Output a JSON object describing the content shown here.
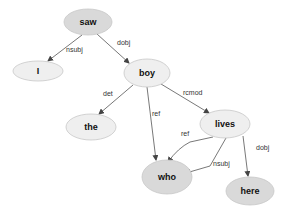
{
  "diagram": {
    "type": "dependency-graph",
    "colors": {
      "light_fill": "#efefef",
      "dark_fill": "#d9d9d9",
      "stroke": "#c8c8c8",
      "edge": "#555555"
    },
    "nodes": [
      {
        "id": "saw",
        "label": "saw",
        "cx": 88,
        "cy": 22,
        "rx": 24,
        "ry": 13,
        "fill": "#d9d9d9"
      },
      {
        "id": "I",
        "label": "I",
        "cx": 38,
        "cy": 71,
        "rx": 25,
        "ry": 10,
        "fill": "#efefef"
      },
      {
        "id": "boy",
        "label": "boy",
        "cx": 147,
        "cy": 73,
        "rx": 23,
        "ry": 14,
        "fill": "#efefef"
      },
      {
        "id": "the",
        "label": "the",
        "cx": 91,
        "cy": 127,
        "rx": 25,
        "ry": 13,
        "fill": "#efefef"
      },
      {
        "id": "lives",
        "label": "lives",
        "cx": 225,
        "cy": 124,
        "rx": 25,
        "ry": 14,
        "fill": "#efefef"
      },
      {
        "id": "who",
        "label": "who",
        "cx": 167,
        "cy": 177,
        "rx": 25,
        "ry": 17,
        "fill": "#d9d9d9"
      },
      {
        "id": "here",
        "label": "here",
        "cx": 250,
        "cy": 191,
        "rx": 24,
        "ry": 14,
        "fill": "#d9d9d9"
      }
    ],
    "edges": [
      {
        "from": "saw",
        "to": "I",
        "label": "nsubj",
        "path": "M82,35 L48,61",
        "lx": 66,
        "ly": 52
      },
      {
        "from": "saw",
        "to": "boy",
        "label": "dobj",
        "path": "M97,34 L129,63",
        "lx": 117,
        "ly": 45
      },
      {
        "from": "boy",
        "to": "the",
        "label": "det",
        "path": "M133,85 L99,114",
        "lx": 103,
        "ly": 96
      },
      {
        "from": "boy",
        "to": "who",
        "label": "ref",
        "path": "M147,87 L156,160",
        "lx": 152,
        "ly": 116
      },
      {
        "from": "boy",
        "to": "lives",
        "label": "rcmod",
        "path": "M161,84 L209,113",
        "lx": 183,
        "ly": 95
      },
      {
        "from": "lives",
        "to": "who",
        "label": "ref",
        "path": "M213,137 L190,142 Q178,148 168,162",
        "lx": 181,
        "ly": 136
      },
      {
        "from": "lives",
        "to": "who",
        "label": "nsubj",
        "path": "M226,138 L210,166 L186,173",
        "lx": 213,
        "ly": 166
      },
      {
        "from": "lives",
        "to": "here",
        "label": "dobj",
        "path": "M243,136 L248,176",
        "lx": 256,
        "ly": 150
      }
    ]
  }
}
